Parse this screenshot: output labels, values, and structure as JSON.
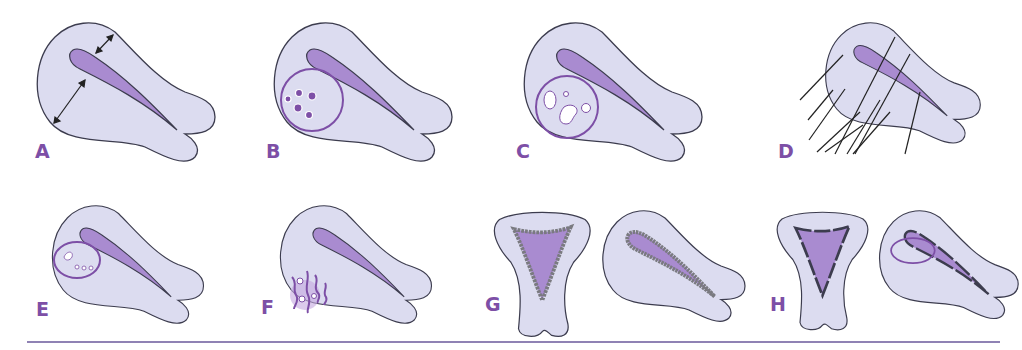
{
  "colors": {
    "body_fill": "#dcdcf0",
    "outline": "#3c3c4e",
    "cavity_fill": "#a98bd0",
    "accent": "#7d4fa6",
    "rule": "#8f82b4",
    "lining_gray": "#7a7a80"
  },
  "panels": [
    {
      "id": "A",
      "label": "A",
      "description": "Sagittal uterus with arrows indicating myometrial wall thickness"
    },
    {
      "id": "B",
      "label": "B",
      "description": "Sagittal uterus with circled region containing small dark foci"
    },
    {
      "id": "C",
      "label": "C",
      "description": "Sagittal uterus with circled region containing cystic spaces"
    },
    {
      "id": "D",
      "label": "D",
      "description": "Sagittal uterus with linear striations crossing the wall"
    },
    {
      "id": "E",
      "label": "E",
      "description": "Sagittal uterus with small oval region at endometrial junction"
    },
    {
      "id": "F",
      "label": "F",
      "description": "Sagittal uterus with wavy vessels and foci in posterior wall"
    },
    {
      "id": "G",
      "label": "G",
      "description": "Coronal and sagittal views with irregular thickened junctional lining"
    },
    {
      "id": "H",
      "label": "H",
      "description": "Coronal and sagittal views with interrupted junctional line and oval focus"
    }
  ]
}
